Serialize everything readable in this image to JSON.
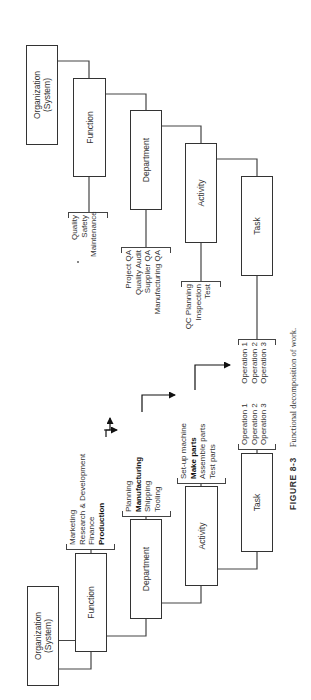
{
  "caption": {
    "figure_label": "FIGURE 8-3",
    "text": "Functional decomposition of work."
  },
  "left_hierarchy": {
    "levels": [
      {
        "name": "Organization",
        "sub": "(System)"
      },
      {
        "name": "Function"
      },
      {
        "name": "Department"
      },
      {
        "name": "Activity"
      },
      {
        "name": "Task"
      }
    ],
    "function_items": [
      {
        "label": "Marketing",
        "bold": false
      },
      {
        "label": "Research & Development",
        "bold": false
      },
      {
        "label": "Finance",
        "bold": false
      },
      {
        "label": "Production",
        "bold": true
      }
    ],
    "department_items": [
      {
        "label": "Planning",
        "bold": false
      },
      {
        "label": "Manufacturing",
        "bold": true
      },
      {
        "label": "Shipping",
        "bold": false
      },
      {
        "label": "Tooling",
        "bold": false
      }
    ],
    "activity_items": [
      {
        "label": "Set-up machine",
        "bold": false
      },
      {
        "label": "Make parts",
        "bold": true
      },
      {
        "label": "Assemble parts",
        "bold": false
      },
      {
        "label": "Test parts",
        "bold": false
      }
    ],
    "task_items": [
      {
        "label": "Operation 1"
      },
      {
        "label": "Operation 2"
      },
      {
        "label": "Operation 3"
      }
    ]
  },
  "right_hierarchy": {
    "levels": [
      {
        "name": "Organization",
        "sub": "(System)"
      },
      {
        "name": "Function"
      },
      {
        "name": "Department"
      },
      {
        "name": "Activity"
      },
      {
        "name": "Task"
      }
    ],
    "function_items": [
      {
        "label": "Quality"
      },
      {
        "label": "Safety"
      },
      {
        "label": "Maintenance"
      }
    ],
    "department_items": [
      {
        "label": "Project QA"
      },
      {
        "label": "Quality Audit"
      },
      {
        "label": "Supplier QA"
      },
      {
        "label": "Manufacturing QA"
      }
    ],
    "activity_items": [
      {
        "label": "QC Planning"
      },
      {
        "label": "Inspection"
      },
      {
        "label": "Test"
      }
    ],
    "task_items": [
      {
        "label": "Operation 1"
      },
      {
        "label": "Operation 2"
      },
      {
        "label": "Operation 3"
      }
    ]
  }
}
